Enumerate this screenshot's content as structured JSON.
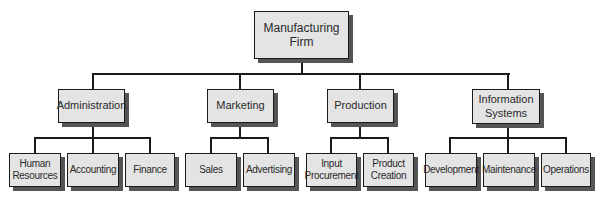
{
  "chart": {
    "root": {
      "label": "Manufacturing Firm",
      "lines": [
        "Manufacturing",
        "Firm"
      ]
    },
    "departments": [
      {
        "label": "Administration",
        "lines": [
          "Administration"
        ],
        "children": [
          {
            "label": "Human Resources",
            "lines": [
              "Human",
              "Resources"
            ]
          },
          {
            "label": "Accounting",
            "lines": [
              "Accounting"
            ]
          },
          {
            "label": "Finance",
            "lines": [
              "Finance"
            ]
          }
        ]
      },
      {
        "label": "Marketing",
        "lines": [
          "Marketing"
        ],
        "children": [
          {
            "label": "Sales",
            "lines": [
              "Sales"
            ]
          },
          {
            "label": "Advertising",
            "lines": [
              "Advertising"
            ]
          }
        ]
      },
      {
        "label": "Production",
        "lines": [
          "Production"
        ],
        "children": [
          {
            "label": "Input Procurement",
            "lines": [
              "Input",
              "Procurement"
            ]
          },
          {
            "label": "Product Creation",
            "lines": [
              "Product",
              "Creation"
            ]
          }
        ]
      },
      {
        "label": "Information Systems",
        "lines": [
          "Information",
          "Systems"
        ],
        "children": [
          {
            "label": "Development",
            "lines": [
              "Development"
            ]
          },
          {
            "label": "Maintenance",
            "lines": [
              "Maintenance"
            ]
          },
          {
            "label": "Operations",
            "lines": [
              "Operations"
            ]
          }
        ]
      }
    ]
  },
  "colors": {
    "box_fill": "#e4e4e4",
    "border": "#1a1a1a",
    "shadow": "#555555",
    "text": "#2a2a2a"
  }
}
